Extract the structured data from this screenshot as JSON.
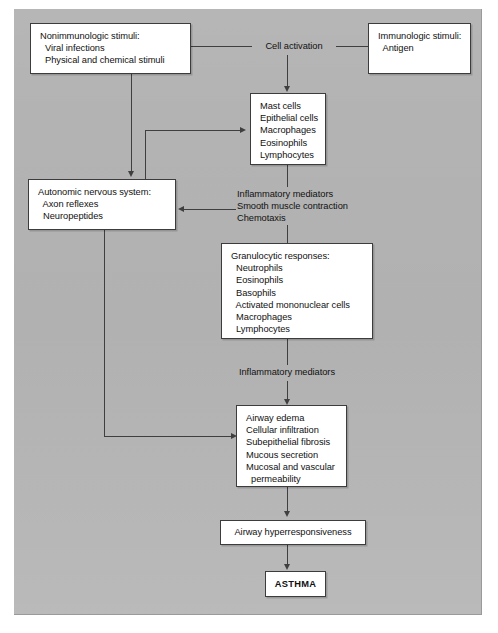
{
  "figure": {
    "background_color": "#b3b3b3",
    "node_fill": "#ffffff",
    "line_color": "#3f3f3f",
    "text_color": "#111111"
  },
  "nodes": {
    "nonimmunologic": "Nonimmunologic stimuli:\n  Viral infections\n  Physical and chemical stimuli",
    "cell_activation": "Cell activation",
    "immunologic": "Immunologic stimuli:\n  Antigen",
    "cells": "Mast cells\nEpithelial cells\nMacrophages\nEosinophils\nLymphocytes",
    "autonomic": "Autonomic nervous system:\n  Axon reflexes\n  Neuropeptides",
    "mediators_upper": "Inflammatory mediators\nSmooth muscle contraction\nChemotaxis",
    "granulocytic": "Granulocytic responses:\n  Neutrophils\n  Eosinophils\n  Basophils\n  Activated mononuclear cells\n  Macrophages\n  Lymphocytes",
    "mediators_lower": "Inflammatory mediators",
    "airway_changes": "Airway edema\nCellular infiltration\nSubepithelial fibrosis\nMucous secretion\nMucosal and vascular\n  permeability",
    "hyperresponsiveness": "Airway hyperresponsiveness",
    "asthma": "ASTHMA"
  },
  "connectors": [
    {
      "name": "nonimmunologic-to-cell-activation",
      "kind": "line"
    },
    {
      "name": "immunologic-to-cell-activation",
      "kind": "line"
    },
    {
      "name": "cell-activation-to-cells",
      "kind": "arrow-down"
    },
    {
      "name": "nonimmunologic-to-autonomic",
      "kind": "arrow-down"
    },
    {
      "name": "autonomic-to-cells-feedback",
      "kind": "arrow-right"
    },
    {
      "name": "cells-to-mediators-upper",
      "kind": "line"
    },
    {
      "name": "mediators-upper-to-autonomic",
      "kind": "arrow-left"
    },
    {
      "name": "mediators-upper-to-granulocytic",
      "kind": "line"
    },
    {
      "name": "granulocytic-to-mediators-lower",
      "kind": "line"
    },
    {
      "name": "mediators-lower-to-airway-changes",
      "kind": "arrow-down"
    },
    {
      "name": "autonomic-to-airway-changes",
      "kind": "arrow-right"
    },
    {
      "name": "airway-changes-to-hyperresponsiveness",
      "kind": "arrow-down"
    },
    {
      "name": "hyperresponsiveness-to-asthma",
      "kind": "arrow-down"
    }
  ]
}
